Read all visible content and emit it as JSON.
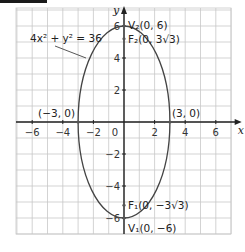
{
  "chart_data": {
    "type": "line",
    "title": "",
    "xlabel": "x",
    "ylabel": "y",
    "xlim": [
      -7,
      7.5
    ],
    "ylim": [
      -7,
      7
    ],
    "grid": true,
    "x_ticks": [
      -6,
      -4,
      -2,
      0,
      2,
      4,
      6
    ],
    "x_tick_labels": [
      "−6",
      "−4",
      "−2",
      "0",
      "2",
      "4",
      "6"
    ],
    "y_ticks": [
      -6,
      -4,
      -2,
      2,
      4,
      6
    ],
    "y_tick_labels": [
      "−6",
      "−4",
      "−2",
      "2",
      "4",
      "6"
    ],
    "series": [
      {
        "name": "4x² + y² = 36",
        "kind": "ellipse",
        "center": [
          0,
          0
        ],
        "semi_axis_x": 3,
        "semi_axis_y": 6,
        "color": "#444444"
      }
    ],
    "equation_label": "4x² + y² = 36",
    "points": [
      {
        "name": "V2",
        "x": 0,
        "y": 6,
        "label": "V₂(0, 6)"
      },
      {
        "name": "F2",
        "x": 0,
        "y": 5.196,
        "label": "F₂(0, 3√3)"
      },
      {
        "name": "left-vertex",
        "x": -3,
        "y": 0,
        "label": "(−3, 0)"
      },
      {
        "name": "right-vertex",
        "x": 3,
        "y": 0,
        "label": "(3, 0)"
      },
      {
        "name": "F1",
        "x": 0,
        "y": -5.196,
        "label": "F₁(0, −3√3)"
      },
      {
        "name": "V1",
        "x": 0,
        "y": -6,
        "label": "V₁(0, −6)"
      }
    ]
  }
}
